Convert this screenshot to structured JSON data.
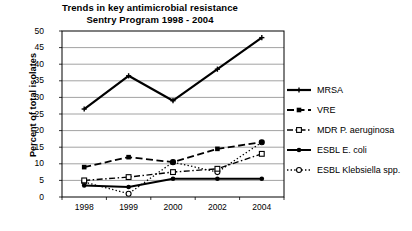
{
  "chart_data": {
    "type": "line",
    "title": "Trends in key antimicrobial resistance\nSentry Program 1998 - 2004",
    "title_line1": "Trends in key antimicrobial resistance",
    "title_line2": "Sentry Program 1998 - 2004",
    "xlabel": "",
    "ylabel": "Percent of total isolates",
    "categories": [
      "1998",
      "1999",
      "2000",
      "2002",
      "2004"
    ],
    "x": [
      1998,
      1999,
      2000,
      2002,
      2004
    ],
    "ylim": [
      0,
      50
    ],
    "yticks": [
      0,
      5,
      10,
      15,
      20,
      25,
      30,
      35,
      40,
      45,
      50
    ],
    "grid": "horizontal",
    "legend_position": "right",
    "series": [
      {
        "name": "MRSA",
        "values": [
          26.5,
          36.5,
          29.0,
          38.5,
          48.0
        ],
        "marker": "plus",
        "line_style": "solid",
        "line_width": 2.2,
        "color": "#000000"
      },
      {
        "name": "VRE",
        "values": [
          9.0,
          12.0,
          10.5,
          14.5,
          16.5
        ],
        "marker": "filled-square",
        "line_style": "dashed",
        "line_width": 1.8,
        "color": "#000000"
      },
      {
        "name": "MDR P. aeruginosa",
        "values": [
          5.0,
          6.0,
          7.5,
          8.5,
          13.0
        ],
        "marker": "open-square",
        "line_style": "dash-dot",
        "line_width": 1.4,
        "color": "#000000"
      },
      {
        "name": "ESBL E. coli",
        "values": [
          3.5,
          3.0,
          5.5,
          5.5,
          5.5
        ],
        "marker": "filled-circle",
        "line_style": "solid",
        "line_width": 2.0,
        "color": "#000000"
      },
      {
        "name": "ESBL Klebsiella spp.",
        "values": [
          4.5,
          1.0,
          10.5,
          7.5,
          16.5
        ],
        "marker": "open-circle",
        "line_style": "dotted",
        "line_width": 1.3,
        "color": "#000000"
      }
    ]
  },
  "axes": {
    "ytick_labels": [
      "50",
      "45",
      "40",
      "35",
      "30",
      "25",
      "20",
      "15",
      "10",
      "5",
      "0"
    ],
    "xtick_labels": [
      "1998",
      "1999",
      "2000",
      "2002",
      "2004"
    ]
  },
  "legend": {
    "items": [
      {
        "label": "MRSA",
        "key": "plus-marker-key"
      },
      {
        "label": "VRE",
        "key": "filled-square-marker-key"
      },
      {
        "label": "MDR P. aeruginosa",
        "key": "open-square-marker-key"
      },
      {
        "label": "ESBL E. coli",
        "key": "filled-circle-marker-key"
      },
      {
        "label": "ESBL Klebsiella spp.",
        "key": "open-circle-marker-key"
      }
    ]
  },
  "colors": {
    "ink": "#000000",
    "grid": "#8a8a8a",
    "frame": "#000000",
    "background": "#ffffff"
  }
}
